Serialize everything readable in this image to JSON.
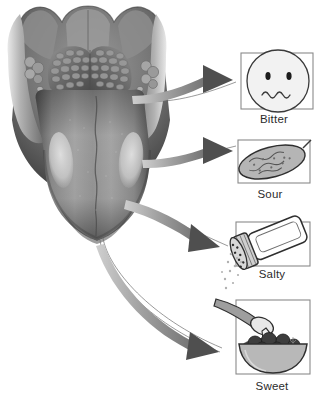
{
  "figure": {
    "type": "anatomical-illustration",
    "background_color": "#ffffff",
    "style": "grayscale"
  },
  "tongue": {
    "name": "tongue-illustration",
    "parts": [
      "oral-cavity-wall",
      "lingual-tonsils",
      "circumvallate-papillae-row",
      "median-sulcus",
      "tongue-body",
      "tongue-tip",
      "taste-zone-patch-left",
      "taste-zone-patch-right"
    ],
    "colors": {
      "tissue_dark": "#4a4a4a",
      "tissue_mid": "#8d8d8d",
      "tissue_light": "#c9c9c9",
      "patch_highlight": "#d8d8d8"
    }
  },
  "arrows": {
    "color": "#9a9a9a",
    "head_color": "#4f4f4f",
    "leader_line_color": "#7a7a7a",
    "items": [
      {
        "target": "Bitter",
        "from": "back-of-tongue"
      },
      {
        "target": "Sour",
        "from": "lateral-posterior-edge"
      },
      {
        "target": "Salty",
        "from": "lateral-anterior-edge"
      },
      {
        "target": "Sweet",
        "from": "tongue-tip"
      }
    ]
  },
  "taste_boxes": [
    {
      "label": "Bitter",
      "icon": "grimacing-face-icon",
      "icon_description": "round face with two dot eyes and a wavy mouth",
      "frame_color": "#8a8a8a",
      "fill": "#f2f2f2"
    },
    {
      "label": "Sour",
      "icon": "pickle-icon",
      "icon_description": "bumpy pickle gherkin with stem",
      "frame_color": "#8a8a8a",
      "fill": "#b5b5b5"
    },
    {
      "label": "Salty",
      "icon": "salt-shaker-icon",
      "icon_description": "tilted salt shaker with perforated cap and falling grains",
      "frame_color": "#8a8a8a",
      "fill": "#ffffff"
    },
    {
      "label": "Sweet",
      "icon": "berry-bowl-icon",
      "icon_description": "bowl of berries with spoon pouring cream",
      "frame_color": "#8a8a8a",
      "fill": "#b8b8b8"
    }
  ]
}
